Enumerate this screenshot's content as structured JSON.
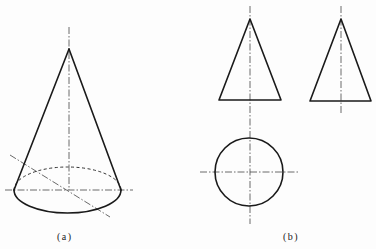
{
  "figure": {
    "colors": {
      "background": "#fdfdfd",
      "line": "#1a1a1a"
    },
    "panel_a": {
      "label": "(a)",
      "view": "pictorial cone",
      "apex": [
        69,
        49
      ],
      "base_ellipse": {
        "cx": 67.5,
        "cy": 190,
        "rx": 53.5,
        "ry": 23
      }
    },
    "panel_b": {
      "label": "(b)",
      "front_view": {
        "shape": "triangle",
        "apex": [
          250,
          19
        ],
        "base_left": [
          219,
          100
        ],
        "base_right": [
          281,
          100
        ]
      },
      "side_view": {
        "shape": "triangle",
        "apex": [
          341,
          19
        ],
        "base_left": [
          310,
          101
        ],
        "base_right": [
          371,
          101
        ]
      },
      "top_view": {
        "shape": "circle",
        "center": [
          249,
          172
        ],
        "radius": 34
      }
    }
  }
}
